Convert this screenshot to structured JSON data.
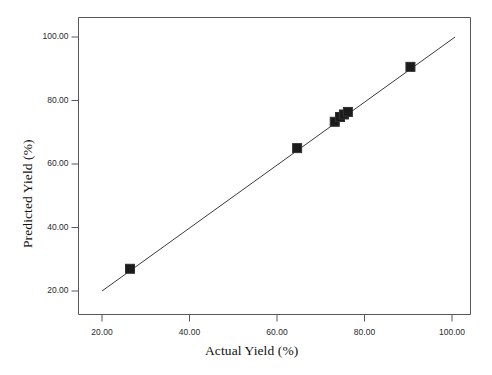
{
  "chart_data": {
    "type": "scatter",
    "title": "",
    "xlabel": "Actual Yield (%)",
    "ylabel": "Predicted Yield (%)",
    "xlim": [
      13,
      105
    ],
    "ylim": [
      14,
      107
    ],
    "grid": false,
    "legend": "none",
    "xticks": [
      20,
      40,
      60,
      80,
      100
    ],
    "yticks": [
      20,
      40,
      60,
      80,
      100
    ],
    "xtick_labels": [
      "20.00",
      "40.00",
      "60.00",
      "80.00",
      "100.00"
    ],
    "ytick_labels": [
      "20.00",
      "40.00",
      "60.00",
      "80.00",
      "100.00"
    ],
    "marker": "filled-square",
    "marker_color": "#1b1b1b",
    "marker_edge_color": "#303030",
    "line_color": "#3b3b3b",
    "reference_line": {
      "name": "identity-fit-line",
      "x": [
        20.0,
        100.7
      ],
      "y": [
        20.0,
        100.0
      ]
    },
    "points": [
      {
        "x": 26.4,
        "y": 27.0
      },
      {
        "x": 64.6,
        "y": 65.0
      },
      {
        "x": 73.2,
        "y": 73.3
      },
      {
        "x": 74.4,
        "y": 74.8
      },
      {
        "x": 75.3,
        "y": 75.6
      },
      {
        "x": 76.2,
        "y": 76.4
      },
      {
        "x": 90.5,
        "y": 90.6
      }
    ]
  },
  "axes": {
    "x_title": "Actual Yield (%)",
    "y_title": "Predicted Yield (%)"
  }
}
